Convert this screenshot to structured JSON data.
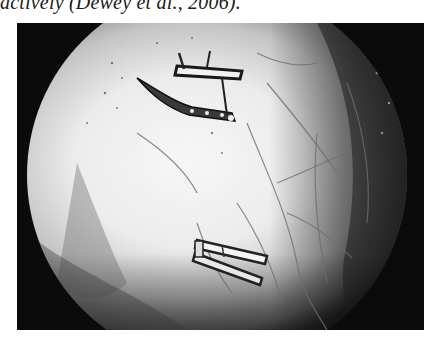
{
  "document": {
    "text_fragment": "actively (Dewey et al., 2006).",
    "figure": {
      "type": "endoscopic-photograph",
      "description": "Grayscale circular endoscopic view showing two surgical clips on tissue with visible vessels",
      "colors": {
        "frame": "#0b0b0b",
        "field_bright": "#f4f4f4",
        "field_mid": "#bdbdbd",
        "field_dark": "#3a3a3a",
        "clip": "#2a2a2a",
        "vessel": "#6e6e6e"
      },
      "objects": [
        {
          "name": "upper-clip",
          "label": "surgical clip"
        },
        {
          "name": "lower-clip",
          "label": "surgical clip"
        }
      ]
    }
  }
}
